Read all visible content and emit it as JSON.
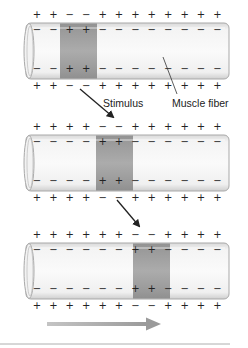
{
  "labels": {
    "stimulus": "Stimulus",
    "muscle_fiber": "Muscle fiber"
  },
  "colors": {
    "tube_fill": "#ececec",
    "tube_stroke": "#a9a9a9",
    "band_fill": "#8f8f8f",
    "sign": "#222222",
    "progress_arrow": "#a6a6a6"
  },
  "stages": [
    {
      "outside_top": [
        "+",
        "+",
        "−",
        "−",
        "+",
        "+",
        "+",
        "+",
        "+",
        "+",
        "+",
        "+"
      ],
      "inside_top": [
        "−",
        "−",
        "+",
        "+",
        "−",
        "−",
        "−",
        "−",
        "−",
        "−",
        "−",
        "−"
      ],
      "inside_bottom": [
        "−",
        "−",
        "+",
        "+",
        "−",
        "−",
        "−",
        "−",
        "−",
        "−",
        "−",
        "−"
      ],
      "outside_bottom": [
        "+",
        "+",
        "−",
        "−",
        "+",
        "+",
        "+",
        "+",
        "+",
        "+",
        "+",
        "+"
      ]
    },
    {
      "outside_top": [
        "+",
        "+",
        "+",
        "+",
        "−",
        "−",
        "+",
        "+",
        "+",
        "+",
        "+",
        "+"
      ],
      "inside_top": [
        "−",
        "−",
        "−",
        "−",
        "+",
        "+",
        "−",
        "−",
        "−",
        "−",
        "−",
        "−"
      ],
      "inside_bottom": [
        "−",
        "−",
        "−",
        "−",
        "+",
        "+",
        "−",
        "−",
        "−",
        "−",
        "−",
        "−"
      ],
      "outside_bottom": [
        "+",
        "+",
        "+",
        "+",
        "−",
        "−",
        "+",
        "+",
        "+",
        "+",
        "+",
        "+"
      ]
    },
    {
      "outside_top": [
        "+",
        "+",
        "+",
        "+",
        "+",
        "+",
        "−",
        "−",
        "+",
        "+",
        "+",
        "+"
      ],
      "inside_top": [
        "−",
        "−",
        "−",
        "−",
        "−",
        "−",
        "+",
        "+",
        "−",
        "−",
        "−",
        "−"
      ],
      "inside_bottom": [
        "−",
        "−",
        "−",
        "−",
        "−",
        "−",
        "+",
        "+",
        "−",
        "−",
        "−",
        "−"
      ],
      "outside_bottom": [
        "+",
        "+",
        "+",
        "+",
        "+",
        "+",
        "−",
        "−",
        "+",
        "+",
        "+",
        "+"
      ]
    }
  ]
}
